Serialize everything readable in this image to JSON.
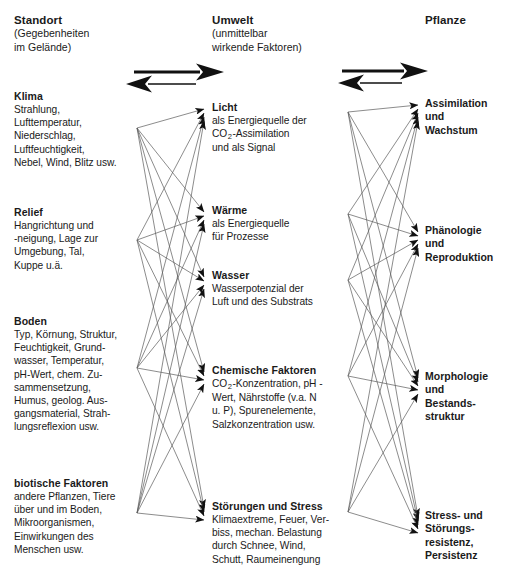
{
  "diagram": {
    "title_implied": "Standort - Umwelt - Pflanze",
    "columns": [
      {
        "id": "standort",
        "head": "Standort",
        "sub": "(Gegebenheiten\nim Gelände)",
        "sub_line1": "(Gegebenheiten",
        "sub_line2": "im Gelände)"
      },
      {
        "id": "umwelt",
        "head": "Umwelt",
        "sub_line1": "(unmittelbar",
        "sub_line2": "wirkende Faktoren)"
      },
      {
        "id": "pflanze",
        "head": "Pflanze",
        "sub_line1": "",
        "sub_line2": ""
      }
    ],
    "left_items": [
      {
        "title": "Klima",
        "body": "Strahlung, Lufttemperatur, Niederschlag, Luftfeuchtigkeit, Nebel, Wind, Blitz usw.",
        "lines": [
          "Strahlung,",
          "Lufttemperatur,",
          "Niederschlag,",
          "Luftfeuchtigkeit,",
          "Nebel, Wind, Blitz usw."
        ]
      },
      {
        "title": "Relief",
        "body": "Hangrichtung und -neigung, Lage zur Umgebung, Tal, Kuppe u.ä.",
        "lines": [
          "Hangrichtung und",
          "-neigung, Lage zur",
          "Umgebung, Tal,",
          "Kuppe u.ä."
        ]
      },
      {
        "title": "Boden",
        "body": "Typ, Körnung, Struktur, Feuchtigkeit, Grundwasser, Temperatur, pH-Wert, chem. Zusammensetzung, Humus, geolog. Ausgangsmaterial, Strahlungsreflexion usw.",
        "lines": [
          "Typ, Körnung, Struktur,",
          "Feuchtigkeit, Grund-",
          "wasser, Temperatur,",
          "pH-Wert, chem. Zu-",
          "sammensetzung,",
          "Humus, geolog. Aus-",
          "gangsmaterial, Strah-",
          "lungsreflexion usw."
        ]
      },
      {
        "title": "biotische Faktoren",
        "body": "andere Pflanzen, Tiere über und im Boden, Mikroorganismen, Einwirkungen des Menschen usw.",
        "lines": [
          "andere Pflanzen, Tiere",
          "über und im Boden,",
          "Mikroorganismen,",
          "Einwirkungen des",
          "Menschen usw."
        ]
      }
    ],
    "middle_items": [
      {
        "title": "Licht",
        "lines": [
          "als Energiequelle der",
          "CO|2|-Assimilation",
          "und als Signal"
        ]
      },
      {
        "title": "Wärme",
        "lines": [
          "als Energiequelle",
          "für Prozesse"
        ]
      },
      {
        "title": "Wasser",
        "lines": [
          "Wasserpotenzial der",
          "Luft und des Substrats"
        ]
      },
      {
        "title": "Chemische Faktoren",
        "lines": [
          "CO|2|-Konzentration, pH -",
          "Wert, Nährstoffe (v.a. N",
          "u. P), Spurenelemente,",
          "Salzkonzentration usw."
        ]
      },
      {
        "title": "Störungen und Stress",
        "lines": [
          "Klimaextreme, Feuer, Ver-",
          "biss, mechan. Belastung",
          "durch Schnee, Wind,",
          "Schutt, Raumeinengung"
        ]
      }
    ],
    "right_items": [
      {
        "title_lines": [
          "Assimilation",
          "und",
          "Wachstum"
        ]
      },
      {
        "title_lines": [
          "Phänologie",
          "und",
          "Reproduktion"
        ]
      },
      {
        "title_lines": [
          "Morphologie",
          "und",
          "Bestands-",
          "struktur"
        ]
      },
      {
        "title_lines": [
          "Stress- und",
          "Störungs-",
          "resistenz,",
          "Persistenz"
        ]
      }
    ],
    "arrows": [
      {
        "id": "arrow-left-pair",
        "forward_label": "",
        "backward_label": "",
        "direction": "bidirectional-asymmetric"
      },
      {
        "id": "arrow-right-pair",
        "forward_label": "",
        "backward_label": "",
        "direction": "bidirectional-asymmetric"
      }
    ],
    "colors": {
      "text": "#1a1a1a",
      "line": "#555555",
      "arrow": "#000000",
      "background": "#ffffff"
    }
  }
}
